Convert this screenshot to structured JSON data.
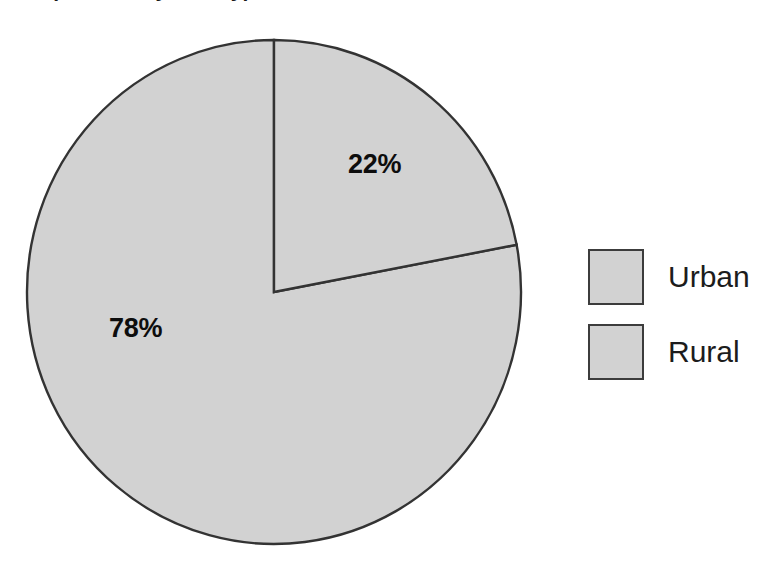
{
  "chart_data": {
    "type": "pie",
    "title": "Population by area type",
    "title_visible": false,
    "categories": [
      "Urban",
      "Rural"
    ],
    "values": [
      22,
      78
    ],
    "value_labels": [
      "22%",
      "78%"
    ],
    "units": "percent",
    "start_angle_deg": 0,
    "direction": "clockwise",
    "legend_position": "right",
    "grid": false,
    "xlabel": "",
    "ylabel": "",
    "slice_colors": [
      "#d2d2d2",
      "#d2d2d2"
    ],
    "slice_border_color": "#333333"
  },
  "legend": {
    "items": [
      {
        "label": "Urban",
        "swatch_color": "#d2d2d2",
        "swatch_border": "#3c3c3c"
      },
      {
        "label": "Rural",
        "swatch_color": "#d2d2d2",
        "swatch_border": "#3c3c3c"
      }
    ]
  },
  "labels": {
    "urban_pct": "22%",
    "rural_pct": "78%"
  },
  "colors": {
    "background": "#ffffff",
    "fill": "#d2d2d2",
    "outline": "#333333",
    "text": "#0d0d0d"
  }
}
